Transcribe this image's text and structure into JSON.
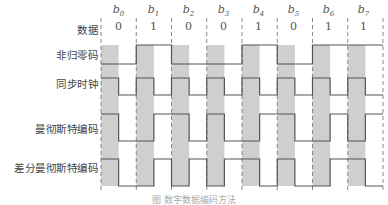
{
  "title": "数字数据编码方法",
  "caption": "图  数字数据编码方法",
  "bits": [
    {
      "label": "b",
      "sub": "0",
      "value": "0"
    },
    {
      "label": "b",
      "sub": "1",
      "value": "1"
    },
    {
      "label": "b",
      "sub": "2",
      "value": "0"
    },
    {
      "label": "b",
      "sub": "3",
      "value": "0"
    },
    {
      "label": "b",
      "sub": "4",
      "value": "1"
    },
    {
      "label": "b",
      "sub": "5",
      "value": "0"
    },
    {
      "label": "b",
      "sub": "6",
      "value": "1"
    },
    {
      "label": "b",
      "sub": "7",
      "value": "1"
    }
  ],
  "rows": {
    "data": "数据",
    "nrz": "非归零码",
    "clock": "同步时钟",
    "manchester": "曼彻斯特编码",
    "diff_manchester": "差分曼彻斯特编码"
  },
  "waveforms": {
    "nrz": [
      "L",
      "L",
      "H",
      "H",
      "L",
      "L",
      "L",
      "L",
      "H",
      "H",
      "L",
      "L",
      "H",
      "H",
      "H",
      "H"
    ],
    "clock": [
      "H",
      "L",
      "H",
      "L",
      "H",
      "L",
      "H",
      "L",
      "H",
      "L",
      "H",
      "L",
      "H",
      "L",
      "H",
      "L"
    ],
    "manchester": [
      "H",
      "L",
      "L",
      "H",
      "H",
      "L",
      "H",
      "L",
      "L",
      "H",
      "H",
      "L",
      "L",
      "H",
      "L",
      "H"
    ],
    "diff_manchester": [
      "H",
      "L",
      "L",
      "H",
      "L",
      "H",
      "L",
      "H",
      "H",
      "L",
      "H",
      "L",
      "L",
      "H",
      "H",
      "L"
    ]
  },
  "colors": {
    "shade": "#cfcfcf",
    "line": "#555555",
    "dash": "#888888"
  }
}
